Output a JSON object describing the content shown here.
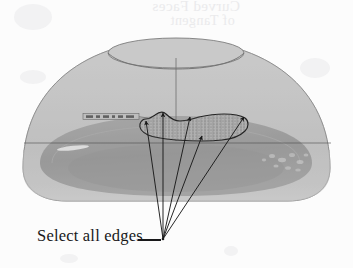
{
  "page": {
    "background_color": "#fcfcfc",
    "width": 353,
    "height": 268,
    "kind": "scanned-book-figure"
  },
  "bleed_through": {
    "description": "faint mirrored show-through text from the reverse side of the scanned page",
    "color": "#e8e8ea",
    "line_1": "Curved Faces",
    "line_2": "of Tangent"
  },
  "caption": {
    "label": "Select all edges",
    "leader_color": "#18181a",
    "text_color": "#18181a"
  },
  "figure": {
    "title": "Select all edges",
    "type": "3d-cad-solid-model",
    "body_fill": "#c4c4c4",
    "body_stroke": "#8e8e8e",
    "cavity_fill": "#8a8a8a",
    "shell_fill": "#b3b3b3",
    "selection_fill": "#9a9a9a",
    "selection_stroke": "#242424",
    "arrow_color": "#1a1a1a",
    "centerline_color": "#6f6f6f",
    "section_line_color": "#4a4a4a",
    "arrow_count": 5,
    "arrow_origin": {
      "x": 163,
      "y": 239
    },
    "arrow_tips": [
      {
        "x": 146,
        "y": 121
      },
      {
        "x": 163,
        "y": 113
      },
      {
        "x": 190,
        "y": 117
      },
      {
        "x": 202,
        "y": 136
      },
      {
        "x": 244,
        "y": 117
      }
    ],
    "inner_label": {
      "text": "",
      "note": "small illegible dark dimension/annotation strip",
      "color": "#5a5a5a"
    }
  }
}
